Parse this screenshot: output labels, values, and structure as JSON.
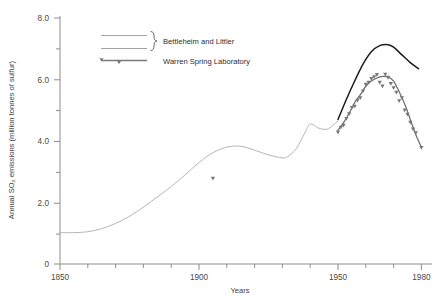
{
  "chart_data": {
    "type": "line",
    "title": "",
    "xlabel": "Years",
    "ylabel": "Annual SO2 emissions (million tonnes of sulfur)",
    "ylabel_display": "Annual SO₂ emissions (million tonnes of sulfur)",
    "xlim": [
      1850,
      1980
    ],
    "ylim": [
      0,
      8.0
    ],
    "grid": false,
    "legend_position": "top-left-inside",
    "x_ticks_major": [
      1850,
      1900,
      1950,
      1980
    ],
    "x_tick_labels": [
      "1850",
      "1900",
      "1950",
      "1980"
    ],
    "x_ticks_minor": [
      1860,
      1870,
      1880,
      1890,
      1910,
      1920,
      1930,
      1940,
      1960,
      1970
    ],
    "y_ticks_major": [
      0,
      2.0,
      4.0,
      6.0,
      8.0
    ],
    "y_tick_labels": [
      "0",
      "2.0",
      "4.0",
      "6.0",
      "8.0"
    ],
    "y_ticks_minor": [
      1.0,
      3.0,
      5.0,
      7.0
    ],
    "series": [
      {
        "name": "Bettleheim and Littler",
        "color": "#b6b6b6",
        "style": "thin-light-line",
        "segment": "historic",
        "x": [
          1850,
          1855,
          1860,
          1865,
          1870,
          1875,
          1880,
          1885,
          1890,
          1895,
          1900,
          1905,
          1910,
          1915,
          1920,
          1925,
          1930,
          1932,
          1935,
          1938,
          1940,
          1943,
          1946,
          1948,
          1950
        ],
        "values": [
          1.02,
          1.02,
          1.05,
          1.15,
          1.32,
          1.55,
          1.85,
          2.18,
          2.52,
          2.9,
          3.3,
          3.62,
          3.8,
          3.83,
          3.7,
          3.55,
          3.45,
          3.5,
          3.75,
          4.25,
          4.55,
          4.42,
          4.38,
          4.5,
          4.65
        ]
      },
      {
        "name": "Bettleheim and Littler",
        "color": "#1d1d1d",
        "style": "dark-line",
        "segment": "modern-upper",
        "x": [
          1950,
          1953,
          1956,
          1959,
          1962,
          1965,
          1968,
          1970,
          1973,
          1976,
          1979
        ],
        "values": [
          4.7,
          5.35,
          5.95,
          6.5,
          6.9,
          7.1,
          7.13,
          7.05,
          6.8,
          6.55,
          6.35
        ]
      },
      {
        "name": "Warren Spring Laboratory",
        "color": "#6f6f6f",
        "style": "line-with-markers",
        "segment": "modern-lower",
        "x": [
          1950,
          1952,
          1954,
          1956,
          1958,
          1960,
          1962,
          1964,
          1966,
          1968,
          1970,
          1972,
          1974,
          1976,
          1978,
          1980
        ],
        "values": [
          4.35,
          4.6,
          4.9,
          5.25,
          5.5,
          5.78,
          5.95,
          6.05,
          6.1,
          6.08,
          5.95,
          5.6,
          5.2,
          4.7,
          4.2,
          3.8
        ]
      }
    ],
    "scatter_markers": {
      "name": "Warren Spring Laboratory data points",
      "marker": "triangle-down",
      "color": "#777777",
      "points": [
        {
          "x": 1905,
          "y": 2.78
        },
        {
          "x": 1950,
          "y": 4.28
        },
        {
          "x": 1951,
          "y": 4.44
        },
        {
          "x": 1952,
          "y": 4.5
        },
        {
          "x": 1953,
          "y": 4.72
        },
        {
          "x": 1954,
          "y": 4.88
        },
        {
          "x": 1955,
          "y": 5.08
        },
        {
          "x": 1956,
          "y": 5.12
        },
        {
          "x": 1957,
          "y": 5.32
        },
        {
          "x": 1958,
          "y": 5.4
        },
        {
          "x": 1959,
          "y": 5.62
        },
        {
          "x": 1960,
          "y": 5.84
        },
        {
          "x": 1961,
          "y": 5.9
        },
        {
          "x": 1962,
          "y": 6.02
        },
        {
          "x": 1963,
          "y": 6.08
        },
        {
          "x": 1964,
          "y": 6.15
        },
        {
          "x": 1965,
          "y": 5.9
        },
        {
          "x": 1966,
          "y": 5.78
        },
        {
          "x": 1967,
          "y": 6.16
        },
        {
          "x": 1968,
          "y": 6.06
        },
        {
          "x": 1969,
          "y": 5.86
        },
        {
          "x": 1970,
          "y": 5.72
        },
        {
          "x": 1971,
          "y": 5.58
        },
        {
          "x": 1972,
          "y": 5.3
        },
        {
          "x": 1973,
          "y": 5.4
        },
        {
          "x": 1974,
          "y": 5.0
        },
        {
          "x": 1975,
          "y": 4.86
        },
        {
          "x": 1976,
          "y": 4.6
        },
        {
          "x": 1977,
          "y": 4.38
        },
        {
          "x": 1978,
          "y": 4.26
        },
        {
          "x": 1980,
          "y": 3.78
        }
      ]
    },
    "legend": [
      {
        "label": "Bettleheim and Littler",
        "swatch": "two-lines-with-brace"
      },
      {
        "label": "Warren Spring Laboratory",
        "swatch": "line-with-triangle-markers"
      }
    ]
  }
}
